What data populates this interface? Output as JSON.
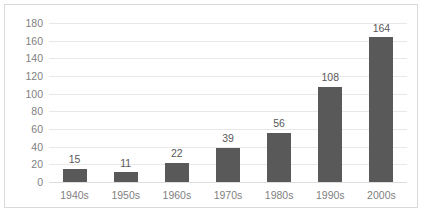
{
  "chart_data": {
    "type": "bar",
    "title": "",
    "subtitle": "",
    "xlabel": "",
    "ylabel": "",
    "categories": [
      "1940s",
      "1950s",
      "1960s",
      "1970s",
      "1980s",
      "1990s",
      "2000s"
    ],
    "values": [
      15,
      11,
      22,
      39,
      56,
      108,
      164
    ],
    "data_labels": [
      "15",
      "11",
      "22",
      "39",
      "56",
      "108",
      "164"
    ],
    "ylim": [
      0,
      180
    ],
    "ytick_step": 20,
    "ytick_labels": [
      "180",
      "160",
      "140",
      "120",
      "100",
      "80",
      "60",
      "40",
      "20",
      "0"
    ],
    "ytick_values": [
      180,
      160,
      140,
      120,
      100,
      80,
      60,
      40,
      20,
      0
    ],
    "grid": true,
    "grid_axis": "y",
    "legend": false,
    "legend_position": "none",
    "series": [
      {
        "name": "",
        "values": [
          15,
          11,
          22,
          39,
          56,
          108,
          164
        ]
      }
    ]
  },
  "style": {
    "bar_color": "#595959",
    "gridline_color": "#e8e8e8",
    "baseline_color": "#dcdcdc",
    "tick_label_color": "#7f7f7f",
    "data_label_color": "#595959",
    "border_color": "#d9d9d9",
    "plot_background": "#ffffff"
  }
}
